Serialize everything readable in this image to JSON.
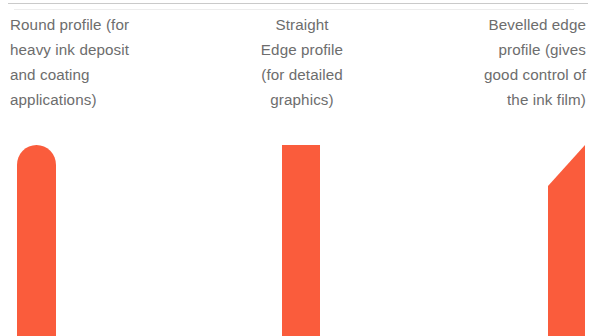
{
  "page": {
    "background_color": "#ffffff",
    "text_color": "#6d6d6d",
    "blade_color": "#fa5c3c"
  },
  "columns": [
    {
      "id": "round",
      "caption": "Round profile (for\nheavy ink deposit\nand coating\napplications)",
      "profile_shape": "round",
      "alignment": "left"
    },
    {
      "id": "straight",
      "caption": "Straight\nEdge profile\n(for detailed\ngraphics)",
      "profile_shape": "straight-edge",
      "alignment": "center"
    },
    {
      "id": "bevelled",
      "caption": "Bevelled edge\nprofile (gives\ngood control of\nthe ink film)",
      "profile_shape": "bevelled-edge",
      "alignment": "right"
    }
  ]
}
